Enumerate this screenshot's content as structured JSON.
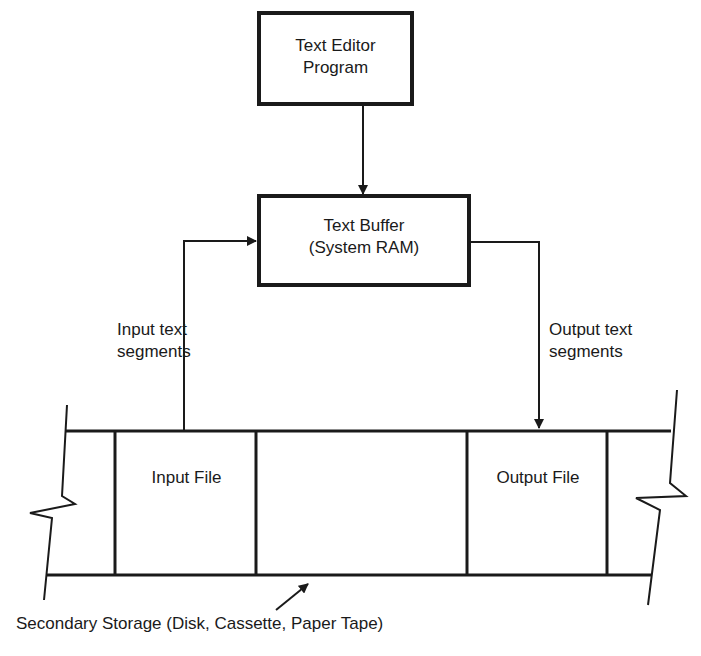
{
  "diagram": {
    "nodes": {
      "editor": {
        "line1": "Text Editor",
        "line2": "Program"
      },
      "buffer": {
        "line1": "Text Buffer",
        "line2": "(System RAM)"
      },
      "input_file": {
        "label": "Input File"
      },
      "output_file": {
        "label": "Output File"
      }
    },
    "edges": {
      "input_segments": {
        "line1": "Input text",
        "line2": "segments"
      },
      "output_segments": {
        "line1": "Output text",
        "line2": "segments"
      }
    },
    "storage_caption": "Secondary Storage (Disk, Cassette, Paper Tape)",
    "colors": {
      "ink": "#1a1a1a",
      "background": "#ffffff"
    }
  }
}
